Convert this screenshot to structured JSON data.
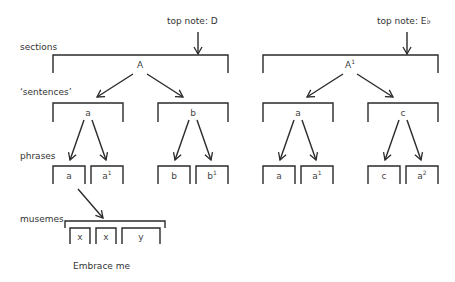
{
  "labels": {
    "sections": "sections",
    "sentences": "‘sentences’",
    "phrases": "phrases",
    "musemes": "musemes",
    "caption": "Embrace me"
  },
  "left": {
    "top_note": "top note: D",
    "section": {
      "base": "A",
      "sup": ""
    },
    "sentences": [
      {
        "base": "a",
        "sup": ""
      },
      {
        "base": "b",
        "sup": ""
      }
    ],
    "phrases": [
      {
        "base": "a",
        "sup": ""
      },
      {
        "base": "a",
        "sup": "1"
      },
      {
        "base": "b",
        "sup": ""
      },
      {
        "base": "b",
        "sup": "1"
      }
    ]
  },
  "right": {
    "top_note": "top note: E♭",
    "section": {
      "base": "A",
      "sup": "1"
    },
    "sentences": [
      {
        "base": "a",
        "sup": ""
      },
      {
        "base": "c",
        "sup": ""
      }
    ],
    "phrases": [
      {
        "base": "a",
        "sup": ""
      },
      {
        "base": "a",
        "sup": "1"
      },
      {
        "base": "c",
        "sup": ""
      },
      {
        "base": "a",
        "sup": "2"
      }
    ]
  },
  "musemes": [
    {
      "base": "x"
    },
    {
      "base": "x"
    },
    {
      "base": "y"
    }
  ],
  "colors": {
    "line": "#2a2a2a",
    "text": "#333333"
  }
}
